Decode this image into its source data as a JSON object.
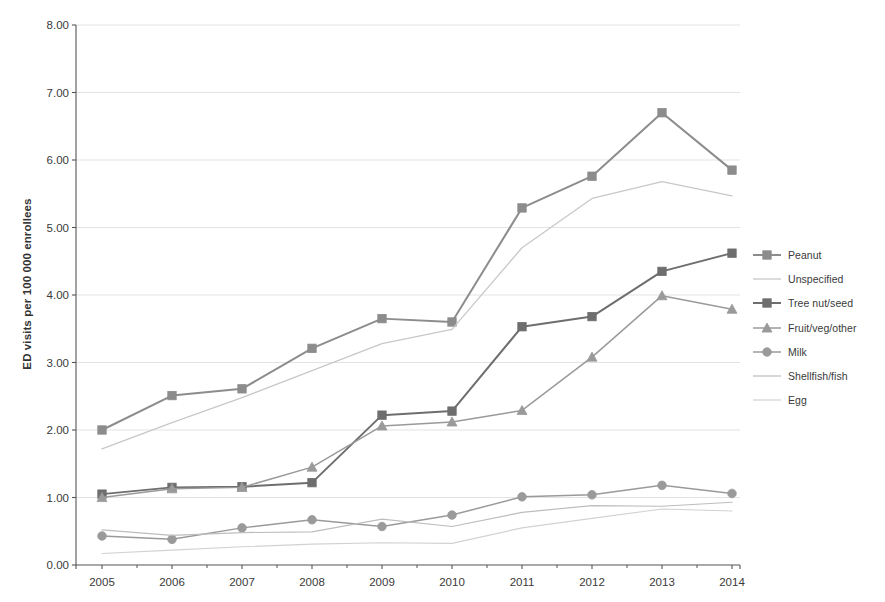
{
  "chart_data": {
    "type": "line",
    "title": "",
    "xlabel": "",
    "ylabel": "ED visits per 100 000 enrollees",
    "categories": [
      "2005",
      "2006",
      "2007",
      "2008",
      "2009",
      "2010",
      "2011",
      "2012",
      "2013",
      "2014"
    ],
    "x": [
      2005,
      2006,
      2007,
      2008,
      2009,
      2010,
      2011,
      2012,
      2013,
      2014
    ],
    "ylim": [
      0.0,
      8.0
    ],
    "xlim": [
      2005,
      2014
    ],
    "y_ticks": [
      "0.00",
      "1.00",
      "2.00",
      "3.00",
      "4.00",
      "5.00",
      "6.00",
      "7.00",
      "8.00"
    ],
    "y_tick_values": [
      0,
      1,
      2,
      3,
      4,
      5,
      6,
      7,
      8
    ],
    "grid": "horizontal",
    "legend_position": "right",
    "series": [
      {
        "name": "Peanut",
        "values": [
          2.0,
          2.51,
          2.61,
          3.21,
          3.65,
          3.6,
          5.29,
          5.76,
          6.7,
          5.85
        ],
        "color": "#8c8c8c",
        "width": 2.0,
        "marker": "square"
      },
      {
        "name": "Unspecified",
        "values": [
          1.72,
          2.11,
          2.48,
          2.88,
          3.28,
          3.49,
          4.7,
          5.43,
          5.68,
          5.47
        ],
        "color": "#c8c8c8",
        "width": 1.3,
        "marker": "none"
      },
      {
        "name": "Tree nut/seed",
        "values": [
          1.05,
          1.15,
          1.16,
          1.22,
          2.22,
          2.28,
          3.53,
          3.68,
          4.35,
          4.62
        ],
        "color": "#6e6e6e",
        "width": 2.0,
        "marker": "square"
      },
      {
        "name": "Fruit/veg/other",
        "values": [
          1.0,
          1.13,
          1.15,
          1.45,
          2.06,
          2.12,
          2.29,
          3.08,
          3.99,
          3.79
        ],
        "color": "#9a9a9a",
        "width": 1.5,
        "marker": "triangle"
      },
      {
        "name": "Milk",
        "values": [
          0.43,
          0.38,
          0.55,
          0.67,
          0.57,
          0.74,
          1.01,
          1.04,
          1.18,
          1.06
        ],
        "color": "#9a9a9a",
        "width": 1.5,
        "marker": "diamond"
      },
      {
        "name": "Shellfish/fish",
        "values": [
          0.52,
          0.44,
          0.48,
          0.49,
          0.68,
          0.57,
          0.78,
          0.88,
          0.87,
          0.93
        ],
        "color": "#bdbdbd",
        "width": 1.2,
        "marker": "none"
      },
      {
        "name": "Egg",
        "values": [
          0.17,
          0.22,
          0.27,
          0.31,
          0.33,
          0.32,
          0.55,
          0.69,
          0.83,
          0.8
        ],
        "color": "#d2d2d2",
        "width": 1.2,
        "marker": "none"
      }
    ]
  },
  "legend": {
    "items": [
      {
        "label": "Peanut"
      },
      {
        "label": "Unspecified"
      },
      {
        "label": "Tree nut/seed"
      },
      {
        "label": "Fruit/veg/other"
      },
      {
        "label": "Milk"
      },
      {
        "label": "Shellfish/fish"
      },
      {
        "label": "Egg"
      }
    ]
  },
  "axis": {
    "color": "#555555",
    "grid_color": "#e3e3e3"
  }
}
